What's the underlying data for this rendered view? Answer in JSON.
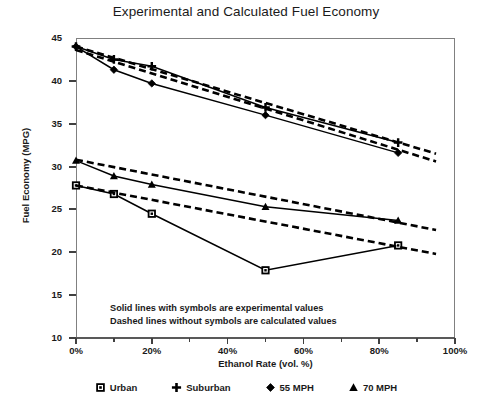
{
  "chart_data": {
    "type": "line",
    "title": "Experimental and Calculated Fuel Economy",
    "xlabel": "Ethanol Rate (vol. %)",
    "ylabel": "Fuel Economy (MPG)",
    "xlim": [
      0,
      100
    ],
    "ylim": [
      10,
      45
    ],
    "xticks": [
      0,
      20,
      40,
      60,
      80,
      100
    ],
    "xtick_labels": [
      "0%",
      "20%",
      "40%",
      "60%",
      "80%",
      "100%"
    ],
    "xminor_ticks": [
      10,
      30,
      50,
      70,
      90
    ],
    "yticks": [
      10,
      15,
      20,
      25,
      30,
      35,
      40,
      45
    ],
    "ytick_labels": [
      "10",
      "15",
      "20",
      "25",
      "30",
      "35",
      "40",
      "45"
    ],
    "grid": false,
    "legend_position": "bottom",
    "annotations": [
      "Solid lines with symbols are experimental values",
      "Dashed lines without symbols are calculated values"
    ],
    "series": [
      {
        "name": "Urban",
        "marker": "square",
        "style": "solid",
        "kind": "experimental",
        "x": [
          0,
          10,
          20,
          50,
          85
        ],
        "values": [
          27.8,
          26.8,
          24.5,
          17.9,
          20.8
        ]
      },
      {
        "name": "Suburban",
        "marker": "plus",
        "style": "solid",
        "kind": "experimental",
        "x": [
          0,
          10,
          20,
          50,
          85
        ],
        "values": [
          44.0,
          42.5,
          41.7,
          36.9,
          32.8
        ]
      },
      {
        "name": "55 MPH",
        "marker": "diamond",
        "style": "solid",
        "kind": "experimental",
        "x": [
          0,
          10,
          20,
          50,
          85
        ],
        "values": [
          44.0,
          41.3,
          39.7,
          36.0,
          31.6
        ]
      },
      {
        "name": "70 MPH",
        "marker": "triangle",
        "style": "solid",
        "kind": "experimental",
        "x": [
          0,
          10,
          20,
          50,
          85
        ],
        "values": [
          30.7,
          28.9,
          27.9,
          25.3,
          23.7
        ]
      },
      {
        "name": "Urban calculated",
        "marker": "none",
        "style": "dashed",
        "kind": "calculated",
        "x": [
          0,
          95
        ],
        "values": [
          27.8,
          19.8
        ]
      },
      {
        "name": "Suburban calculated",
        "marker": "none",
        "style": "dashed",
        "kind": "calculated",
        "x": [
          0,
          95
        ],
        "values": [
          44.0,
          31.5
        ]
      },
      {
        "name": "55 MPH calculated",
        "marker": "none",
        "style": "dashed",
        "kind": "calculated",
        "x": [
          0,
          95
        ],
        "values": [
          43.6,
          30.6
        ]
      },
      {
        "name": "70 MPH calculated",
        "marker": "none",
        "style": "dashed",
        "kind": "calculated",
        "x": [
          0,
          95
        ],
        "values": [
          30.8,
          22.6
        ]
      }
    ]
  },
  "legend": {
    "items": [
      {
        "label": "Urban",
        "marker": "square-marker"
      },
      {
        "label": "Suburban",
        "marker": "plus-marker"
      },
      {
        "label": "55 MPH",
        "marker": "diamond-marker"
      },
      {
        "label": "70 MPH",
        "marker": "triangle-marker"
      }
    ]
  },
  "colors": {
    "line": "#000000",
    "axis": "#808080",
    "tick": "#404040",
    "text": "#1a1a1a",
    "background": "#ffffff"
  }
}
